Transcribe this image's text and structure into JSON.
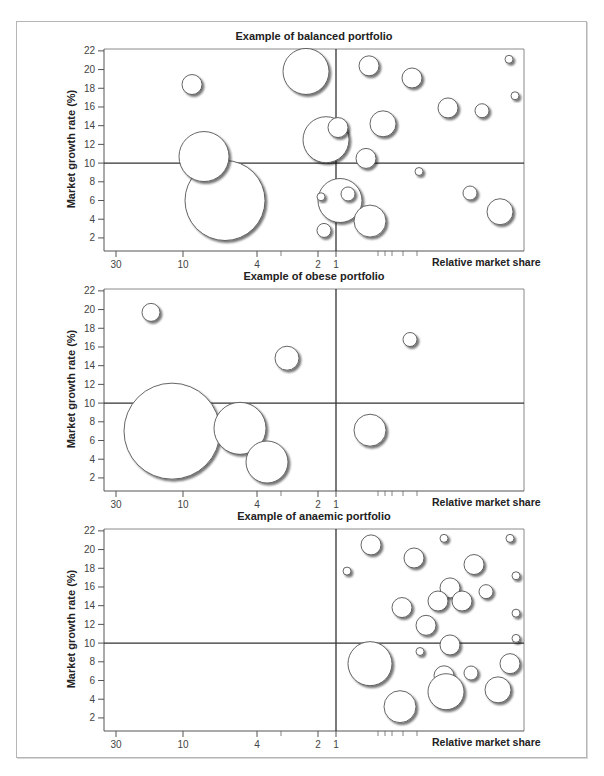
{
  "figure": {
    "caption": ""
  },
  "axes": {
    "ylabel": "Market growth rate (%)",
    "xlabel": "Relative market share",
    "y_ticks": [
      "22",
      "20",
      "18",
      "16",
      "14",
      "12",
      "10",
      "8",
      "6",
      "4",
      "2"
    ],
    "x_ticks": [
      "30",
      "10",
      "4",
      "2",
      "1"
    ]
  },
  "panels": [
    {
      "title": "Example of balanced portfolio"
    },
    {
      "title": "Example of obese portfolio"
    },
    {
      "title": "Example of anaemic portfolio"
    }
  ],
  "chart_data": [
    {
      "type": "scatter",
      "subtype": "bubble (BCG growth-share matrix)",
      "title": "Example of balanced portfolio",
      "xlabel": "Relative market share",
      "ylabel": "Market growth rate (%)",
      "x_scale": "log, reversed (high share on left)",
      "x_ticks": [
        30,
        10,
        4,
        2,
        1
      ],
      "ylim": [
        1,
        22
      ],
      "y_ticks": [
        2,
        4,
        6,
        8,
        10,
        12,
        14,
        16,
        18,
        20,
        22
      ],
      "dividers": {
        "x": 1,
        "y": 10
      },
      "grid": false,
      "legend": null,
      "bubbles_note": "x_px = horizontal pixel offset from plot left edge (0-420); y = growth rate; r = radius px",
      "bubbles": [
        {
          "x_px": 121,
          "y": 6.0,
          "r": 40
        },
        {
          "x_px": 100,
          "y": 10.7,
          "r": 25
        },
        {
          "x_px": 88,
          "y": 18.4,
          "r": 10
        },
        {
          "x_px": 202,
          "y": 19.8,
          "r": 23
        },
        {
          "x_px": 222,
          "y": 12.5,
          "r": 23
        },
        {
          "x_px": 234,
          "y": 13.8,
          "r": 10
        },
        {
          "x_px": 265,
          "y": 20.4,
          "r": 10
        },
        {
          "x_px": 308,
          "y": 19.1,
          "r": 10
        },
        {
          "x_px": 279,
          "y": 14.2,
          "r": 13
        },
        {
          "x_px": 262,
          "y": 10.5,
          "r": 10
        },
        {
          "x_px": 344,
          "y": 15.9,
          "r": 10
        },
        {
          "x_px": 378,
          "y": 15.6,
          "r": 7
        },
        {
          "x_px": 405,
          "y": 21.1,
          "r": 4
        },
        {
          "x_px": 411,
          "y": 17.2,
          "r": 4
        },
        {
          "x_px": 315,
          "y": 9.1,
          "r": 4
        },
        {
          "x_px": 236,
          "y": 6.0,
          "r": 22
        },
        {
          "x_px": 244,
          "y": 6.7,
          "r": 7
        },
        {
          "x_px": 266,
          "y": 3.8,
          "r": 16
        },
        {
          "x_px": 217,
          "y": 6.4,
          "r": 4
        },
        {
          "x_px": 220,
          "y": 2.8,
          "r": 7
        },
        {
          "x_px": 366,
          "y": 6.8,
          "r": 7
        },
        {
          "x_px": 396,
          "y": 4.8,
          "r": 13
        }
      ]
    },
    {
      "type": "scatter",
      "subtype": "bubble (BCG growth-share matrix)",
      "title": "Example of obese portfolio",
      "xlabel": "Relative market share",
      "ylabel": "Market growth rate (%)",
      "x_scale": "log, reversed (high share on left)",
      "x_ticks": [
        30,
        10,
        4,
        2,
        1
      ],
      "ylim": [
        1,
        22
      ],
      "y_ticks": [
        2,
        4,
        6,
        8,
        10,
        12,
        14,
        16,
        18,
        20,
        22
      ],
      "dividers": {
        "x": 1,
        "y": 10
      },
      "grid": false,
      "legend": null,
      "bubbles": [
        {
          "x_px": 47,
          "y": 19.7,
          "r": 9
        },
        {
          "x_px": 68,
          "y": 7.0,
          "r": 48
        },
        {
          "x_px": 136,
          "y": 7.3,
          "r": 26
        },
        {
          "x_px": 163,
          "y": 3.7,
          "r": 21
        },
        {
          "x_px": 183,
          "y": 14.8,
          "r": 12
        },
        {
          "x_px": 306,
          "y": 16.8,
          "r": 7
        },
        {
          "x_px": 266,
          "y": 7.1,
          "r": 16
        }
      ]
    },
    {
      "type": "scatter",
      "subtype": "bubble (BCG growth-share matrix)",
      "title": "Example of anaemic portfolio",
      "xlabel": "Relative market share",
      "ylabel": "Market growth rate (%)",
      "x_scale": "log, reversed (high share on left)",
      "x_ticks": [
        30,
        10,
        4,
        2,
        1
      ],
      "ylim": [
        1,
        22
      ],
      "y_ticks": [
        2,
        4,
        6,
        8,
        10,
        12,
        14,
        16,
        18,
        20,
        22
      ],
      "dividers": {
        "x": 1,
        "y": 10
      },
      "grid": false,
      "legend": null,
      "bubbles": [
        {
          "x_px": 267,
          "y": 20.5,
          "r": 10
        },
        {
          "x_px": 310,
          "y": 19.1,
          "r": 10
        },
        {
          "x_px": 340,
          "y": 21.2,
          "r": 4
        },
        {
          "x_px": 406,
          "y": 21.2,
          "r": 4
        },
        {
          "x_px": 243,
          "y": 17.7,
          "r": 4
        },
        {
          "x_px": 370,
          "y": 18.4,
          "r": 10
        },
        {
          "x_px": 412,
          "y": 17.2,
          "r": 4
        },
        {
          "x_px": 346,
          "y": 15.9,
          "r": 10
        },
        {
          "x_px": 382,
          "y": 15.5,
          "r": 7
        },
        {
          "x_px": 334,
          "y": 14.5,
          "r": 10
        },
        {
          "x_px": 358,
          "y": 14.5,
          "r": 10
        },
        {
          "x_px": 298,
          "y": 13.8,
          "r": 10
        },
        {
          "x_px": 412,
          "y": 13.2,
          "r": 4
        },
        {
          "x_px": 322,
          "y": 11.9,
          "r": 10
        },
        {
          "x_px": 346,
          "y": 9.8,
          "r": 10
        },
        {
          "x_px": 412,
          "y": 10.5,
          "r": 4
        },
        {
          "x_px": 316,
          "y": 9.1,
          "r": 4
        },
        {
          "x_px": 266,
          "y": 7.8,
          "r": 22
        },
        {
          "x_px": 340,
          "y": 6.5,
          "r": 10
        },
        {
          "x_px": 342,
          "y": 4.8,
          "r": 18
        },
        {
          "x_px": 367,
          "y": 6.8,
          "r": 7
        },
        {
          "x_px": 406,
          "y": 7.8,
          "r": 10
        },
        {
          "x_px": 296,
          "y": 3.2,
          "r": 16
        },
        {
          "x_px": 394,
          "y": 5.0,
          "r": 13
        }
      ]
    }
  ]
}
